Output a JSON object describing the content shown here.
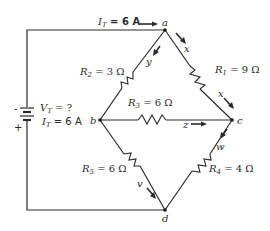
{
  "diagram": {
    "type": "circuit",
    "source": {
      "voltage_label": "V",
      "voltage_sub": "T",
      "voltage_value": " = ?",
      "current_label": "I",
      "current_sub": "T",
      "current_value": " = 6 A",
      "neg_sign": "-",
      "pos_sign": "+"
    },
    "top_current": {
      "label": "I",
      "sub": "T",
      "value": " = 6 A"
    },
    "nodes": {
      "a": "a",
      "b": "b",
      "c": "c",
      "d": "d"
    },
    "resistors": {
      "r1": {
        "name": "R",
        "sub": "1",
        "value": " = 9 Ω"
      },
      "r2": {
        "name": "R",
        "sub": "2",
        "value": " = 3 Ω"
      },
      "r3": {
        "name": "R",
        "sub": "3",
        "value": " = 6 Ω"
      },
      "r4": {
        "name": "R",
        "sub": "4",
        "value": " = 4 Ω"
      },
      "r5": {
        "name": "R",
        "sub": "5",
        "value": " = 6 Ω"
      }
    },
    "currents": {
      "x_upper": "x",
      "x_lower": "x",
      "y": "y",
      "z": "z",
      "w": "w",
      "v": "v"
    }
  }
}
